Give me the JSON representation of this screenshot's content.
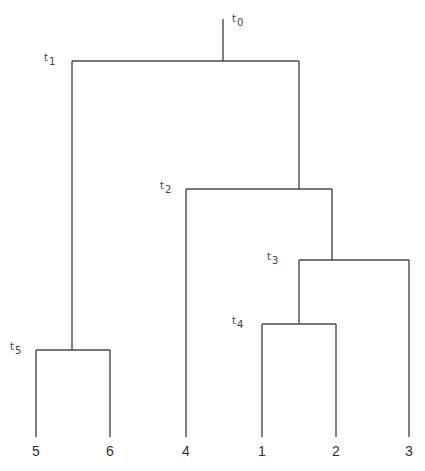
{
  "diagram": {
    "type": "dendrogram",
    "line_color": "#4a4a4a",
    "root_stem": {
      "x": 223,
      "y_top": 19,
      "y_bottom": 61
    },
    "nodes": [
      {
        "id": "t0",
        "label_base": "t",
        "label_sub": "0",
        "label_pos": {
          "x": 232,
          "y": 14
        }
      },
      {
        "id": "t1",
        "label_base": "t",
        "label_sub": "1",
        "bar": {
          "x1": 72,
          "x2": 299,
          "y": 61
        },
        "label_pos": {
          "x": 44,
          "y": 53
        }
      },
      {
        "id": "t2",
        "label_base": "t",
        "label_sub": "2",
        "bar": {
          "x1": 186,
          "x2": 332,
          "y": 189
        },
        "label_pos": {
          "x": 160,
          "y": 181
        }
      },
      {
        "id": "t3",
        "label_base": "t",
        "label_sub": "3",
        "bar": {
          "x1": 299,
          "x2": 409,
          "y": 260
        },
        "label_pos": {
          "x": 267,
          "y": 252
        }
      },
      {
        "id": "t4",
        "label_base": "t",
        "label_sub": "4",
        "bar": {
          "x1": 262,
          "x2": 336,
          "y": 324
        },
        "label_pos": {
          "x": 232,
          "y": 316
        }
      },
      {
        "id": "t5",
        "label_base": "t",
        "label_sub": "5",
        "bar": {
          "x1": 36,
          "x2": 110,
          "y": 350
        },
        "label_pos": {
          "x": 10,
          "y": 342
        }
      }
    ],
    "verticals": [
      {
        "x": 72,
        "y1": 61,
        "y2": 350
      },
      {
        "x": 299,
        "y1": 61,
        "y2": 189
      },
      {
        "x": 186,
        "y1": 189,
        "y2": 437
      },
      {
        "x": 332,
        "y1": 189,
        "y2": 260
      },
      {
        "x": 299,
        "y1": 260,
        "y2": 324
      },
      {
        "x": 409,
        "y1": 260,
        "y2": 437
      },
      {
        "x": 262,
        "y1": 324,
        "y2": 437
      },
      {
        "x": 336,
        "y1": 324,
        "y2": 437
      },
      {
        "x": 36,
        "y1": 350,
        "y2": 437
      },
      {
        "x": 110,
        "y1": 350,
        "y2": 437
      }
    ],
    "leaves": [
      {
        "label": "5",
        "x": 36
      },
      {
        "label": "6",
        "x": 110
      },
      {
        "label": "4",
        "x": 186
      },
      {
        "label": "1",
        "x": 262
      },
      {
        "label": "2",
        "x": 336
      },
      {
        "label": "3",
        "x": 409
      }
    ],
    "leaf_label_y": 444
  }
}
